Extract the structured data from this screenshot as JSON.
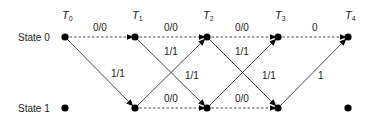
{
  "diagram": {
    "type": "trellis",
    "time_labels": [
      {
        "base": "T",
        "sub": "0"
      },
      {
        "base": "T",
        "sub": "1"
      },
      {
        "base": "T",
        "sub": "2"
      },
      {
        "base": "T",
        "sub": "3"
      },
      {
        "base": "T",
        "sub": "4"
      }
    ],
    "state_labels": [
      "State 0",
      "State 1"
    ],
    "edges": [
      {
        "from": [
          "T0",
          "State 0"
        ],
        "to": [
          "T1",
          "State 0"
        ],
        "style": "dashed",
        "label": "0/0"
      },
      {
        "from": [
          "T0",
          "State 0"
        ],
        "to": [
          "T1",
          "State 1"
        ],
        "style": "solid",
        "label": "1/1"
      },
      {
        "from": [
          "T1",
          "State 0"
        ],
        "to": [
          "T2",
          "State 0"
        ],
        "style": "dashed",
        "label": "0/0"
      },
      {
        "from": [
          "T1",
          "State 0"
        ],
        "to": [
          "T2",
          "State 1"
        ],
        "style": "solid",
        "label": "1/1"
      },
      {
        "from": [
          "T1",
          "State 1"
        ],
        "to": [
          "T2",
          "State 0"
        ],
        "style": "solid",
        "label": "1/1"
      },
      {
        "from": [
          "T1",
          "State 1"
        ],
        "to": [
          "T2",
          "State 1"
        ],
        "style": "dashed",
        "label": "0/0"
      },
      {
        "from": [
          "T2",
          "State 0"
        ],
        "to": [
          "T3",
          "State 0"
        ],
        "style": "dashed",
        "label": "0/0"
      },
      {
        "from": [
          "T2",
          "State 0"
        ],
        "to": [
          "T3",
          "State 1"
        ],
        "style": "solid",
        "label": "1/1"
      },
      {
        "from": [
          "T2",
          "State 1"
        ],
        "to": [
          "T3",
          "State 0"
        ],
        "style": "solid",
        "label": "1/1"
      },
      {
        "from": [
          "T2",
          "State 1"
        ],
        "to": [
          "T3",
          "State 1"
        ],
        "style": "dashed",
        "label": "0/0"
      },
      {
        "from": [
          "T3",
          "State 0"
        ],
        "to": [
          "T4",
          "State 0"
        ],
        "style": "dashed",
        "label": "0"
      },
      {
        "from": [
          "T3",
          "State 1"
        ],
        "to": [
          "T4",
          "State 0"
        ],
        "style": "solid",
        "label": "1"
      }
    ],
    "edge_labels": {
      "t0_s0_s0": "0/0",
      "t0_s0_s1": "1/1",
      "t1_s0_s0": "0/0",
      "t1_s0_s1": "1/1",
      "t1_s1_s0": "1/1",
      "t1_s1_s1": "0/0",
      "t2_s0_s0": "0/0",
      "t2_s0_s1": "1/1",
      "t2_s1_s0": "1/1",
      "t2_s1_s1": "0/0",
      "t3_s0_s0": "0",
      "t3_s1_s0": "1"
    }
  }
}
